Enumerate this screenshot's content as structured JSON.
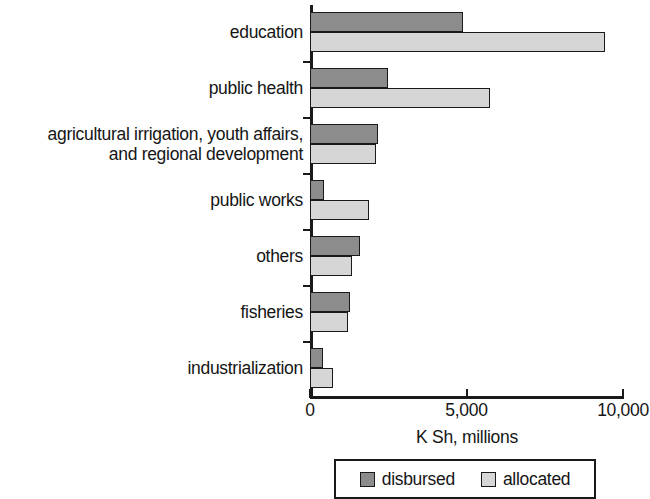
{
  "chart_data": {
    "type": "bar",
    "orientation": "horizontal",
    "title": "",
    "xlabel": "K Sh, millions",
    "ylabel": "",
    "xlim": [
      0,
      10000
    ],
    "xticks": [
      0,
      5000,
      10000
    ],
    "xtick_labels": [
      "0",
      "5,000",
      "10,000"
    ],
    "grid": false,
    "legend_position": "bottom",
    "categories": [
      "education",
      "public health",
      "agricultural irrigation, youth affairs,\nand regional development",
      "public works",
      "others",
      "fisheries",
      "industrialization"
    ],
    "series": [
      {
        "name": "disbursed",
        "color": "#8c8c8c",
        "values": [
          4890,
          2490,
          2170,
          450,
          1600,
          1280,
          420
        ]
      },
      {
        "name": "allocated",
        "color": "#d6d6d6",
        "values": [
          9425,
          5750,
          2100,
          1890,
          1340,
          1220,
          740
        ]
      }
    ]
  },
  "legend": {
    "items": [
      {
        "label": "disbursed",
        "color": "#8c8c8c"
      },
      {
        "label": "allocated",
        "color": "#d6d6d6"
      }
    ]
  },
  "colors": {
    "disbursed": "#8c8c8c",
    "allocated": "#d6d6d6",
    "axis": "#1a1a1a",
    "text": "#151515",
    "background": "#ffffff"
  }
}
